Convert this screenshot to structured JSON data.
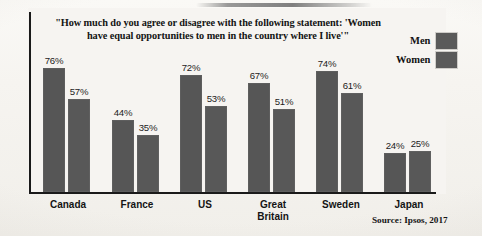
{
  "chart_data": {
    "type": "bar",
    "title": "\"How much do you agree or disagree with the following statement: 'Women have equal opportunities to men in the country where I live'\"",
    "title_line1": "\"How much do you agree or disagree with the following statement: 'Women have",
    "title_line2": "equal opportunities to men in the country where I live'\"",
    "xlabel": "",
    "ylabel": "",
    "ylim": [
      0,
      100
    ],
    "grid": false,
    "legend_position": "top-right",
    "categories": [
      "Canada",
      "France",
      "US",
      "Great Britain",
      "Sweden",
      "Japan"
    ],
    "category_lines": [
      [
        "Canada"
      ],
      [
        "France"
      ],
      [
        "US"
      ],
      [
        "Great",
        "Britain"
      ],
      [
        "Sweden"
      ],
      [
        "Japan"
      ]
    ],
    "series": [
      {
        "name": "Men",
        "color": "#565656",
        "values": [
          76,
          44,
          72,
          67,
          74,
          24
        ],
        "labels": [
          "76%",
          "44%",
          "72%",
          "67%",
          "74%",
          "24%"
        ]
      },
      {
        "name": "Women",
        "color": "#585858",
        "values": [
          57,
          35,
          53,
          51,
          61,
          25
        ],
        "labels": [
          "57%",
          "35%",
          "53%",
          "51%",
          "61%",
          "25%"
        ]
      }
    ],
    "source": "Source: Ipsos, 2017"
  },
  "legend": {
    "items": [
      {
        "label": "Men"
      },
      {
        "label": "Women"
      }
    ]
  },
  "colors": {
    "bar": "#565656",
    "axis": "#1a1a1a",
    "background": "#f6f4f1",
    "text": "#141414"
  }
}
